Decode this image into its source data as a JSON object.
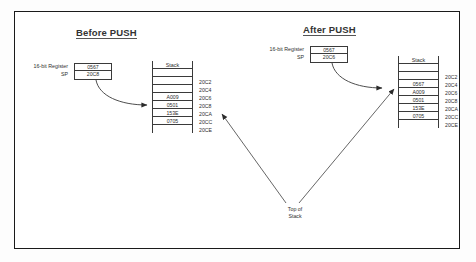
{
  "diagram": {
    "caption_top_of_stack": "Top of\nStack",
    "top_of_stack_line1": "Top of",
    "top_of_stack_line2": "Stack",
    "frame_color": "#1a1a1a",
    "line_color": "#3a3a3a",
    "background": "#ffffff"
  },
  "panels": [
    {
      "id": "before",
      "title": "Before PUSH",
      "register": {
        "label_line1": "16-bit Register",
        "label_line2": "SP",
        "value_top": "0567",
        "value_bottom": "20C8"
      },
      "stack": {
        "header": "Stack",
        "rows": [
          "",
          "",
          "",
          "A009",
          "0501",
          "153E",
          "0705",
          ""
        ],
        "addresses": [
          "20C2",
          "20C4",
          "20C6",
          "20C8",
          "20CA",
          "20CC",
          "20CE"
        ],
        "top_of_stack_address": "20C8"
      }
    },
    {
      "id": "after",
      "title": "After PUSH",
      "register": {
        "label_line1": "16-bit Register",
        "label_line2": "SP",
        "value_top": "0567",
        "value_bottom": "20C6"
      },
      "stack": {
        "header": "Stack",
        "rows": [
          "",
          "",
          "0567",
          "A009",
          "0501",
          "153E",
          "0705",
          ""
        ],
        "addresses": [
          "20C2",
          "20C4",
          "20C6",
          "20C8",
          "20CA",
          "20CC",
          "20CE"
        ],
        "top_of_stack_address": "20C6"
      }
    }
  ]
}
